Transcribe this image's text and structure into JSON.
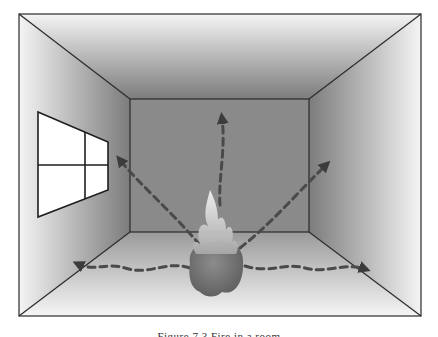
{
  "figure": {
    "colors": {
      "frame_line": "#2a2a2a",
      "back_wall": "#8a8a8a",
      "wall_edge_light": "#f4f4f4",
      "wall_inner_dark": "#7c7c7c",
      "floor_light": "#f2f2f2",
      "window_fill": "#ffffff",
      "arrow": "#4a4a4a",
      "fire_base": "#6f6f6f",
      "flame": "#d8d8d8"
    },
    "geometry": {
      "outer": {
        "x1": 19,
        "y1": 14,
        "x2": 421,
        "y2": 316
      },
      "inner": {
        "x1": 130,
        "y1": 99,
        "x2": 309,
        "y2": 232
      }
    },
    "arrows": [
      {
        "name": "arrow-up-ceiling",
        "tip": [
          222,
          115
        ]
      },
      {
        "name": "arrow-up-left-wall",
        "tip": [
          118,
          157
        ]
      },
      {
        "name": "arrow-up-right-wall",
        "tip": [
          328,
          162
        ]
      },
      {
        "name": "arrow-left-floor",
        "tip": [
          75,
          263
        ]
      },
      {
        "name": "arrow-right-floor",
        "tip": [
          368,
          270
        ]
      }
    ],
    "window": {
      "panes": 4
    }
  },
  "caption": {
    "text": "Figure 7.3  Fire in a room"
  }
}
